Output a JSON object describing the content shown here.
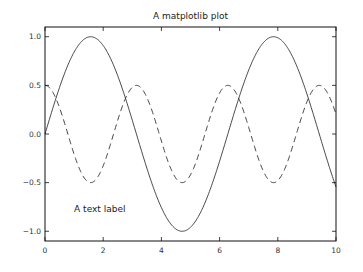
{
  "chart_data": {
    "type": "line",
    "title": "A matplotlib plot",
    "xlabel": "",
    "ylabel": "",
    "xlim": [
      0,
      10
    ],
    "ylim": [
      -1.1,
      1.1
    ],
    "xticks": [
      0,
      2,
      4,
      6,
      8,
      10
    ],
    "xtick_labels": [
      "0",
      "2",
      "4",
      "6",
      "8",
      "10"
    ],
    "yticks": [
      1.0,
      0.5,
      0.0,
      -0.5,
      -1.0
    ],
    "ytick_labels": [
      "1.0",
      "0.5",
      "0.0",
      "−0.5",
      "−1.0"
    ],
    "grid": false,
    "legend": null,
    "series": [
      {
        "name": "sin(x)",
        "style": "solid",
        "color": "#333333",
        "formula": "sin(x)",
        "x": [
          0,
          0.5,
          1.0,
          1.5708,
          2.0,
          2.5,
          3.0,
          3.1416,
          3.5,
          4.0,
          4.5,
          4.7124,
          5.0,
          5.5,
          6.0,
          6.2832,
          6.5,
          7.0,
          7.5,
          7.854,
          8.0,
          8.5,
          9.0,
          9.4248,
          9.5,
          10.0
        ],
        "values": [
          0,
          0.479,
          0.841,
          1.0,
          0.909,
          0.598,
          0.141,
          0.0,
          -0.351,
          -0.757,
          -0.978,
          -1.0,
          -0.959,
          -0.706,
          -0.279,
          0.0,
          0.215,
          0.657,
          0.938,
          1.0,
          0.989,
          0.798,
          0.412,
          0.0,
          -0.075,
          -0.544
        ]
      },
      {
        "name": "0.5*cos(2x)",
        "style": "dashed",
        "color": "#333333",
        "formula": "0.5*cos(2*x)",
        "x": [
          0,
          0.7854,
          1.5708,
          2.3562,
          3.1416,
          3.927,
          4.7124,
          5.4978,
          6.2832,
          7.0686,
          7.854,
          8.6394,
          9.4248,
          10.0
        ],
        "values": [
          0.5,
          0.0,
          -0.5,
          0.0,
          0.5,
          0.0,
          -0.5,
          0.0,
          0.5,
          0.0,
          -0.5,
          0.0,
          0.5,
          0.204
        ]
      }
    ],
    "annotations": [
      {
        "text": "A text label",
        "x": 1.0,
        "y": -0.8
      }
    ]
  }
}
